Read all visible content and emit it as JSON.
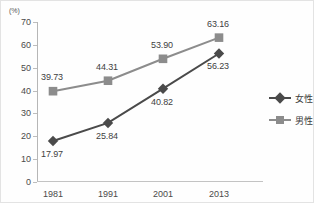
{
  "chart_data": {
    "type": "line",
    "title": "",
    "subtitle": "",
    "unit_label": "(%)",
    "xlabel": "",
    "ylabel": "",
    "categories": [
      "1981",
      "1991",
      "2001",
      "2013"
    ],
    "ylim": [
      0,
      70
    ],
    "ytick_labels": [
      "0",
      "10",
      "20",
      "30",
      "40",
      "50",
      "60",
      "70"
    ],
    "ytick_values": [
      0,
      10,
      20,
      30,
      40,
      50,
      60,
      70
    ],
    "grid": false,
    "legend_position": "right",
    "series": [
      {
        "name": "女性",
        "marker": "diamond",
        "color": "#4a4a4a",
        "values": [
          17.97,
          25.84,
          40.82,
          56.23
        ],
        "labels": [
          "17.97",
          "25.84",
          "40.82",
          "56.23"
        ],
        "label_positions": [
          "below",
          "below",
          "below",
          "below"
        ]
      },
      {
        "name": "男性",
        "marker": "square",
        "color": "#8c8c8c",
        "values": [
          39.73,
          44.31,
          53.9,
          63.16
        ],
        "labels": [
          "39.73",
          "44.31",
          "53.90",
          "63.16"
        ],
        "label_positions": [
          "above",
          "above",
          "above",
          "above"
        ]
      }
    ],
    "colors": {
      "female": "#4a4a4a",
      "male": "#8c8c8c",
      "axis": "#b6b6b6",
      "text": "#3f3f3f",
      "background": "#fefefe"
    }
  },
  "legend": {
    "entries": [
      {
        "label": "女性",
        "marker": "diamond",
        "color": "#4a4a4a"
      },
      {
        "label": "男性",
        "marker": "square",
        "color": "#8c8c8c"
      }
    ]
  }
}
